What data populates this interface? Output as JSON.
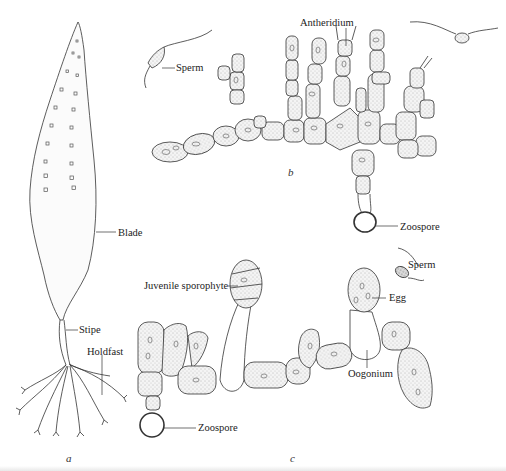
{
  "figure": {
    "panels": [
      {
        "id": "a",
        "label": "a",
        "subject": "sporophyte",
        "parts": [
          "Blade",
          "Stipe",
          "Holdfast"
        ]
      },
      {
        "id": "b",
        "label": "b",
        "subject": "male gametophyte",
        "parts": [
          "Sperm",
          "Antheridium",
          "Zoospore"
        ]
      },
      {
        "id": "c",
        "label": "c",
        "subject": "female gametophyte",
        "parts": [
          "Juvenile sporophyte",
          "Sperm",
          "Egg",
          "Oogonium",
          "Zoospore"
        ]
      }
    ]
  },
  "labels": {
    "blade": "Blade",
    "stipe": "Stipe",
    "holdfast": "Holdfast",
    "sperm_b": "Sperm",
    "antheridium": "Antheridium",
    "zoospore_b": "Zoospore",
    "juvenile_sporophyte": "Juvenile sporophyte",
    "sperm_c": "Sperm",
    "egg": "Egg",
    "oogonium": "Oogonium",
    "zoospore_c": "Zoospore",
    "panel_a": "a",
    "panel_b": "b",
    "panel_c": "c"
  },
  "colors": {
    "ink": "#222222",
    "stipple": "#e9e9e9",
    "background": "#ffffff"
  }
}
